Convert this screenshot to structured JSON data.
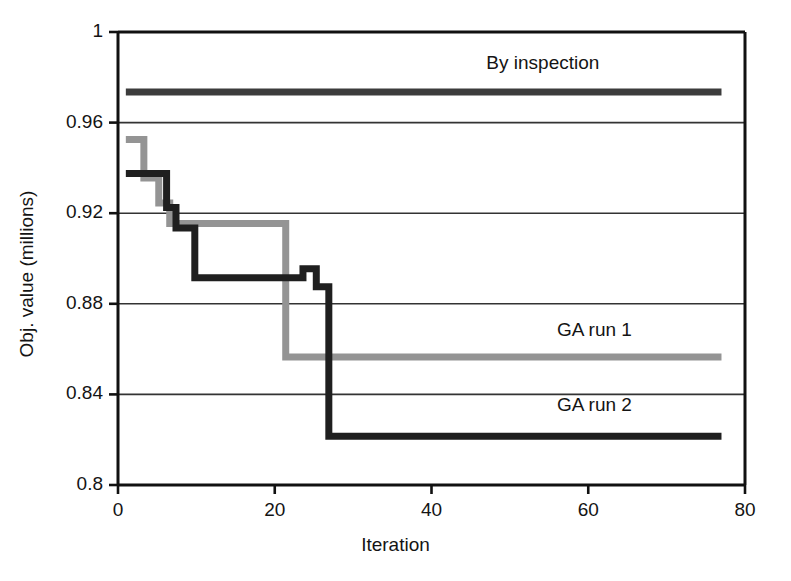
{
  "chart_data": {
    "type": "line",
    "title": "",
    "xlabel": "Iteration",
    "ylabel": "Obj. value (millions)",
    "xlim": [
      0,
      80
    ],
    "ylim": [
      0.8,
      1
    ],
    "xticks": [
      0,
      20,
      40,
      60,
      80
    ],
    "yticks": [
      0.8,
      0.84,
      0.88,
      0.92,
      0.96,
      1
    ],
    "ytick_labels": [
      "0.8",
      "0.84",
      "0.88",
      "0.92",
      "0.96",
      "1"
    ],
    "xtick_labels": [
      "0",
      "20",
      "40",
      "60",
      "80"
    ],
    "grid": "horizontal",
    "legend": "inline-annotations",
    "series": [
      {
        "name": "By inspection",
        "color": "#3c3c3c",
        "linewidth": 7,
        "style": "constant",
        "value": 0.9735,
        "label_x": 47,
        "label_y": 0.9855,
        "points": [
          [
            1,
            0.9735
          ],
          [
            77,
            0.9735
          ]
        ]
      },
      {
        "name": "GA run 1",
        "color": "#949494",
        "linewidth": 7,
        "style": "step",
        "label_x": 56,
        "label_y": 0.8675,
        "points": [
          [
            1,
            0.9525
          ],
          [
            3.3,
            0.9525
          ],
          [
            3.3,
            0.9355
          ],
          [
            5.2,
            0.9355
          ],
          [
            5.2,
            0.9245
          ],
          [
            6.6,
            0.9245
          ],
          [
            6.6,
            0.9155
          ],
          [
            21.4,
            0.9155
          ],
          [
            21.4,
            0.8565
          ],
          [
            77,
            0.8565
          ]
        ]
      },
      {
        "name": "GA run 2",
        "color": "#1f1f1f",
        "linewidth": 7,
        "style": "step",
        "label_x": 56,
        "label_y": 0.8345,
        "points": [
          [
            1,
            0.9375
          ],
          [
            6.2,
            0.9375
          ],
          [
            6.2,
            0.9225
          ],
          [
            7.4,
            0.9225
          ],
          [
            7.4,
            0.9135
          ],
          [
            9.8,
            0.9135
          ],
          [
            9.8,
            0.8915
          ],
          [
            23.6,
            0.8915
          ],
          [
            23.6,
            0.8955
          ],
          [
            25.3,
            0.8955
          ],
          [
            25.3,
            0.8875
          ],
          [
            26.9,
            0.8875
          ],
          [
            26.9,
            0.8215
          ],
          [
            77,
            0.8215
          ]
        ]
      }
    ]
  },
  "axes": {
    "frame_color": "#111111",
    "gridline_color": "#333333"
  }
}
